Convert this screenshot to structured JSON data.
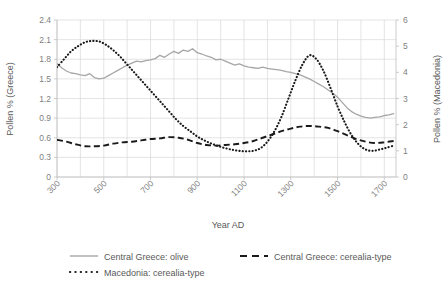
{
  "chart_data": {
    "type": "line",
    "title": "",
    "xlabel": "Year AD",
    "ylabel": "Pollen % (Greece)",
    "ylabel_secondary": "Pollen % (Macedonia)",
    "xlim": [
      300,
      1750
    ],
    "ylim": [
      0,
      2.4
    ],
    "ylim_secondary": [
      0,
      6
    ],
    "grid": true,
    "legend_position": "bottom",
    "xticks": [
      "300",
      "500",
      "700",
      "900",
      "1100",
      "1300",
      "1500",
      "1700"
    ],
    "xtick_values": [
      300,
      500,
      700,
      900,
      1100,
      1300,
      1500,
      1700
    ],
    "x_minor_interval": 100,
    "yticks": [
      "0",
      "0.3",
      "0.6",
      "0.9",
      "1.2",
      "1.5",
      "1.8",
      "2.1",
      "2.4"
    ],
    "ytick_values": [
      0,
      0.3,
      0.6,
      0.9,
      1.2,
      1.5,
      1.8,
      2.1,
      2.4
    ],
    "yticks_secondary": [
      "0",
      "1",
      "2",
      "3",
      "4",
      "5",
      "6"
    ],
    "ytick_values_secondary": [
      0,
      1,
      2,
      3,
      4,
      5,
      6
    ],
    "series": [
      {
        "name": "Central Greece: olive",
        "axis": "left",
        "style": "solid",
        "color": "#a6a6a6",
        "x": [
          300,
          320,
          340,
          360,
          380,
          400,
          420,
          440,
          460,
          480,
          500,
          520,
          540,
          560,
          580,
          600,
          620,
          640,
          660,
          680,
          700,
          720,
          740,
          760,
          780,
          800,
          820,
          840,
          860,
          880,
          900,
          920,
          940,
          960,
          980,
          1000,
          1020,
          1040,
          1060,
          1080,
          1100,
          1120,
          1140,
          1160,
          1180,
          1200,
          1220,
          1240,
          1260,
          1280,
          1300,
          1320,
          1340,
          1360,
          1380,
          1400,
          1420,
          1440,
          1460,
          1480,
          1500,
          1520,
          1540,
          1560,
          1580,
          1600,
          1620,
          1640,
          1660,
          1680,
          1700,
          1720,
          1740
        ],
        "y": [
          1.73,
          1.67,
          1.62,
          1.59,
          1.58,
          1.56,
          1.55,
          1.58,
          1.52,
          1.5,
          1.51,
          1.55,
          1.59,
          1.63,
          1.67,
          1.71,
          1.74,
          1.77,
          1.76,
          1.78,
          1.79,
          1.81,
          1.86,
          1.83,
          1.88,
          1.92,
          1.89,
          1.94,
          1.92,
          1.96,
          1.9,
          1.88,
          1.85,
          1.83,
          1.79,
          1.8,
          1.77,
          1.74,
          1.71,
          1.73,
          1.7,
          1.68,
          1.67,
          1.66,
          1.68,
          1.66,
          1.65,
          1.64,
          1.63,
          1.61,
          1.6,
          1.58,
          1.56,
          1.53,
          1.5,
          1.46,
          1.42,
          1.38,
          1.33,
          1.28,
          1.22,
          1.14,
          1.06,
          1.0,
          0.96,
          0.93,
          0.91,
          0.9,
          0.91,
          0.92,
          0.94,
          0.95,
          0.97
        ]
      },
      {
        "name": "Central Greece: cerealia-type",
        "axis": "left",
        "style": "dashed",
        "color": "#1a1a1a",
        "x": [
          300,
          340,
          380,
          420,
          460,
          500,
          540,
          580,
          620,
          660,
          700,
          740,
          780,
          820,
          860,
          900,
          940,
          980,
          1020,
          1060,
          1100,
          1140,
          1180,
          1220,
          1260,
          1300,
          1340,
          1380,
          1420,
          1460,
          1500,
          1540,
          1580,
          1620,
          1660,
          1700,
          1740
        ],
        "y": [
          0.57,
          0.54,
          0.5,
          0.47,
          0.47,
          0.48,
          0.51,
          0.53,
          0.54,
          0.56,
          0.58,
          0.59,
          0.61,
          0.6,
          0.57,
          0.52,
          0.49,
          0.48,
          0.49,
          0.5,
          0.52,
          0.55,
          0.6,
          0.65,
          0.7,
          0.74,
          0.77,
          0.78,
          0.77,
          0.75,
          0.7,
          0.64,
          0.58,
          0.54,
          0.52,
          0.53,
          0.55
        ]
      },
      {
        "name": "Macedonia: cerealia-type",
        "axis": "right",
        "style": "dotted",
        "color": "#1a1a1a",
        "x": [
          300,
          330,
          360,
          390,
          420,
          450,
          480,
          510,
          540,
          570,
          600,
          630,
          660,
          690,
          720,
          750,
          780,
          810,
          840,
          870,
          900,
          930,
          960,
          990,
          1020,
          1050,
          1080,
          1110,
          1140,
          1170,
          1200,
          1230,
          1260,
          1290,
          1320,
          1350,
          1380,
          1410,
          1440,
          1470,
          1500,
          1530,
          1560,
          1590,
          1620,
          1650,
          1680,
          1710,
          1740
        ],
        "y": [
          4.2,
          4.5,
          4.8,
          5.0,
          5.15,
          5.2,
          5.18,
          5.05,
          4.85,
          4.6,
          4.3,
          4.0,
          3.7,
          3.4,
          3.1,
          2.8,
          2.5,
          2.2,
          1.95,
          1.75,
          1.55,
          1.4,
          1.28,
          1.18,
          1.1,
          1.04,
          1.0,
          0.98,
          1.0,
          1.1,
          1.35,
          1.75,
          2.3,
          3.0,
          3.7,
          4.3,
          4.65,
          4.5,
          4.05,
          3.4,
          2.7,
          2.1,
          1.6,
          1.25,
          1.05,
          1.0,
          1.05,
          1.12,
          1.2
        ]
      }
    ]
  },
  "legend": {
    "items": [
      {
        "label": "Central Greece: olive",
        "style": "solid"
      },
      {
        "label": "Central Greece: cerealia-type",
        "style": "dashed"
      },
      {
        "label": "Macedonia: cerealia-type",
        "style": "dotted"
      }
    ]
  }
}
